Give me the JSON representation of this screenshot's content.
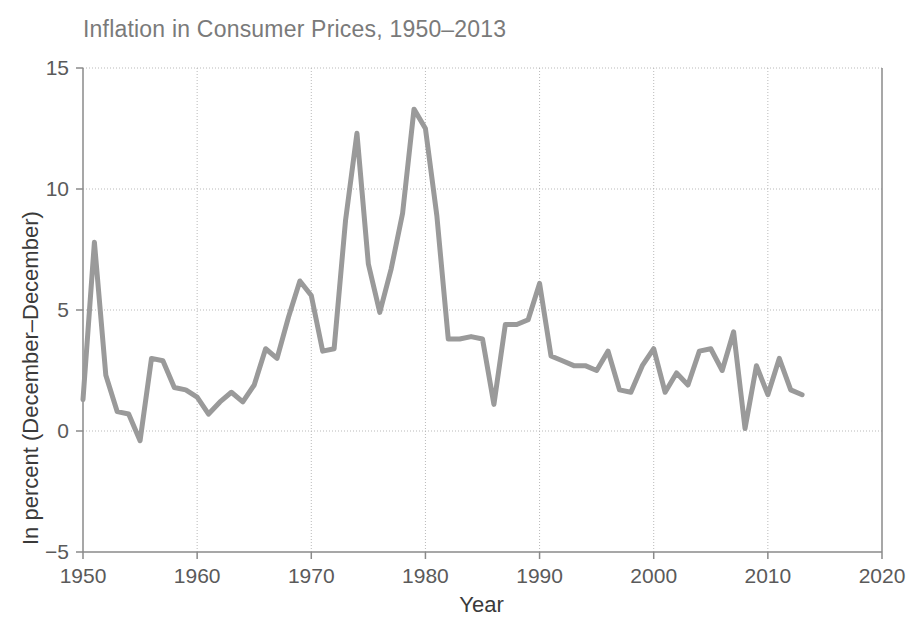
{
  "chart_data": {
    "type": "line",
    "title": "Inflation in Consumer Prices, 1950–2013",
    "xlabel": "Year",
    "ylabel": "In percent (December–December)",
    "xlim": [
      1950,
      2020
    ],
    "ylim": [
      -5,
      15
    ],
    "xticks": [
      1950,
      1960,
      1970,
      1980,
      1990,
      2000,
      2010,
      2020
    ],
    "xtick_labels": [
      "1950",
      "1960",
      "1970",
      "1980",
      "1990",
      "2000",
      "2010",
      "2020"
    ],
    "yticks": [
      -5,
      0,
      5,
      10,
      15
    ],
    "ytick_labels": [
      "−5",
      "0",
      "5",
      "10",
      "15"
    ],
    "grid": true,
    "grid_style": "dotted",
    "legend": false,
    "line_color": "#9a9a9a",
    "line_width": 5,
    "axis_color": "#888888",
    "series": [
      {
        "name": "Inflation in consumer prices",
        "x": [
          1950,
          1951,
          1952,
          1953,
          1954,
          1955,
          1956,
          1957,
          1958,
          1959,
          1960,
          1961,
          1962,
          1963,
          1964,
          1965,
          1966,
          1967,
          1968,
          1969,
          1970,
          1971,
          1972,
          1973,
          1974,
          1975,
          1976,
          1977,
          1978,
          1979,
          1980,
          1981,
          1982,
          1983,
          1984,
          1985,
          1986,
          1987,
          1988,
          1989,
          1990,
          1991,
          1992,
          1993,
          1994,
          1995,
          1996,
          1997,
          1998,
          1999,
          2000,
          2001,
          2002,
          2003,
          2004,
          2005,
          2006,
          2007,
          2008,
          2009,
          2010,
          2011,
          2012,
          2013
        ],
        "values": [
          1.3,
          7.8,
          2.3,
          0.8,
          0.7,
          -0.4,
          3.0,
          2.9,
          1.8,
          1.7,
          1.4,
          0.7,
          1.2,
          1.6,
          1.2,
          1.9,
          3.4,
          3.0,
          4.7,
          6.2,
          5.6,
          3.3,
          3.4,
          8.7,
          12.3,
          6.9,
          4.9,
          6.7,
          9.0,
          13.3,
          12.5,
          8.9,
          3.8,
          3.8,
          3.9,
          3.8,
          1.1,
          4.4,
          4.4,
          4.6,
          6.1,
          3.1,
          2.9,
          2.7,
          2.7,
          2.5,
          3.3,
          1.7,
          1.6,
          2.7,
          3.4,
          1.6,
          2.4,
          1.9,
          3.3,
          3.4,
          2.5,
          4.1,
          0.1,
          2.7,
          1.5,
          3.0,
          1.7,
          1.5
        ]
      }
    ]
  },
  "chart": {
    "title": "Inflation in Consumer Prices, 1950–2013",
    "x_axis_title": "Year",
    "y_axis_title": "In percent (December–December)",
    "y_tick_labels": [
      "15",
      "10",
      "5",
      "0",
      "−5"
    ],
    "x_tick_labels": [
      "1950",
      "1960",
      "1970",
      "1980",
      "1990",
      "2000",
      "2010",
      "2020"
    ],
    "colors": {
      "line": "#9a9a9a",
      "grid": "#b9b9b9",
      "axis": "#8a8a8a",
      "title_text": "#7a7a7a",
      "tick_text": "#5a5a5a",
      "axis_title_text": "#3a3a3a",
      "background": "#ffffff"
    }
  }
}
